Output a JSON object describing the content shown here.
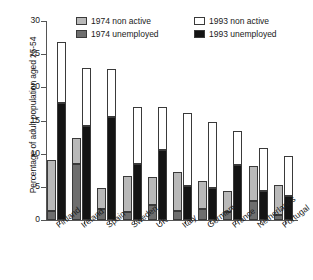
{
  "chart_data": {
    "type": "bar",
    "title": "",
    "subtitle": "",
    "xlabel": "",
    "ylabel": "Percentage of adult population aged 25-54",
    "ylim": [
      0,
      30
    ],
    "yticks": [
      0,
      5,
      10,
      15,
      20,
      25,
      30
    ],
    "ytick_labels": [
      "0",
      "5",
      "10",
      "15",
      "20",
      "25",
      "30"
    ],
    "grid": false,
    "stacked": true,
    "legend_position": "top-inside",
    "legend": [
      {
        "key": "na74",
        "label": "1974 non active",
        "color": "#b9b9b9"
      },
      {
        "key": "un74",
        "label": "1974 unemployed",
        "color": "#6e6e6e"
      },
      {
        "key": "na93",
        "label": "1993 non active",
        "color": "#ffffff"
      },
      {
        "key": "un93",
        "label": "1993 unemployed",
        "color": "#141414"
      }
    ],
    "categories": [
      "Finland",
      "Ireland",
      "Spain",
      "Sweden",
      "UK",
      "Italy",
      "Germany",
      "France",
      "Netherlands",
      "Portugal"
    ],
    "series": [
      {
        "name": "1974 unemployed",
        "key": "un74",
        "values": [
          1.4,
          8.4,
          1.6,
          1.2,
          2.2,
          1.3,
          1.7,
          1.2,
          2.8,
          0.7
        ]
      },
      {
        "name": "1974 non active",
        "key": "na74",
        "values": [
          7.7,
          4.0,
          3.3,
          5.4,
          4.3,
          6.0,
          4.2,
          3.2,
          5.3,
          4.6
        ]
      },
      {
        "name": "1993 unemployed",
        "key": "un93",
        "values": [
          17.7,
          14.1,
          15.5,
          8.4,
          10.5,
          5.1,
          4.8,
          8.3,
          4.4,
          3.6
        ]
      },
      {
        "name": "1993 non active",
        "key": "na93",
        "values": [
          9.1,
          8.8,
          7.3,
          8.7,
          6.6,
          11.1,
          10.0,
          5.1,
          6.4,
          6.1
        ]
      }
    ],
    "totals_1974": [
      9.1,
      12.4,
      4.9,
      6.6,
      6.5,
      7.3,
      5.9,
      4.4,
      8.1,
      5.3
    ],
    "totals_1993": [
      26.8,
      22.9,
      22.8,
      17.1,
      17.1,
      16.2,
      14.8,
      13.4,
      10.8,
      9.7
    ]
  }
}
